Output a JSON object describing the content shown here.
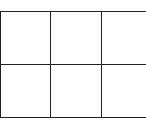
{
  "diagram": {
    "type": "grid",
    "rows": 2,
    "columns": 3,
    "cells": [
      [
        "",
        "",
        ""
      ],
      [
        "",
        "",
        ""
      ]
    ],
    "line_color": "#222222",
    "background": "#ffffff"
  }
}
